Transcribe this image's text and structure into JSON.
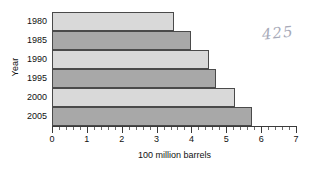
{
  "chart_data": {
    "type": "bar",
    "orientation": "horizontal",
    "title": "",
    "xlabel": "100 million barrels",
    "ylabel": "Year",
    "categories": [
      "1980",
      "1985",
      "1990",
      "1995",
      "2000",
      "2005"
    ],
    "values": [
      3.5,
      4.0,
      4.5,
      4.7,
      5.25,
      5.75
    ],
    "xlim": [
      0,
      7
    ],
    "x_tick_labels": [
      "0",
      "1",
      "2",
      "3",
      "4",
      "5",
      "6",
      "7"
    ],
    "x_major_step": 1,
    "x_minor_step": 0.2,
    "grid": false,
    "legend": "none",
    "bar_colors": [
      "#d9d9d9",
      "#a8a8a8",
      "#d9d9d9",
      "#a8a8a8",
      "#d9d9d9",
      "#a8a8a8"
    ],
    "bar_edge_color": "#4a4a4a",
    "axis_color": "#3a3a3a"
  },
  "annotations": {
    "handwritten_note": "425"
  }
}
